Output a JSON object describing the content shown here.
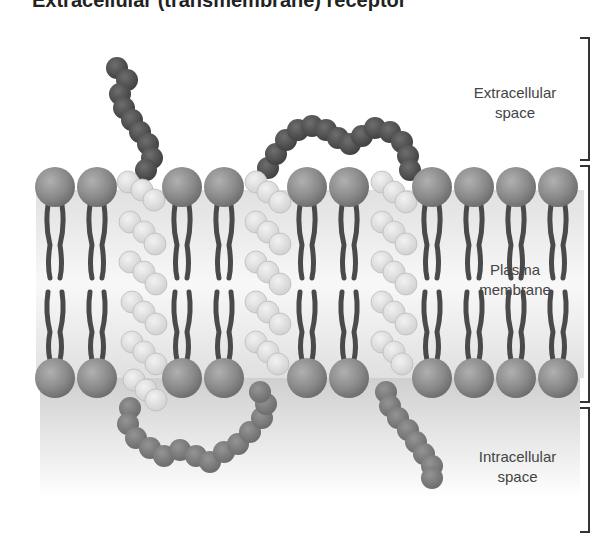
{
  "title": "Extracellular (transmembrane) receptor",
  "labels": {
    "extracellular": [
      "Extracellular",
      "space"
    ],
    "membrane": [
      "Plasma",
      "membrane"
    ],
    "intracellular": [
      "Intracellular",
      "space"
    ]
  },
  "colors": {
    "lipid_head": "#8c8c8c",
    "lipid_tail": "#4a4a4a",
    "helix": "#dcdcdc",
    "extracellular_loop": "#5a5a5a",
    "intracellular_loop": "#7e7e7e",
    "bracket": "#333333"
  },
  "diagram": {
    "lipid_head_x": [
      55,
      97,
      182,
      224,
      307,
      349,
      432,
      474,
      516,
      558
    ],
    "top_head_y": 187,
    "bottom_head_y": 378,
    "helix_x": [
      140,
      267,
      393
    ],
    "transmembrane_helices": 3
  }
}
